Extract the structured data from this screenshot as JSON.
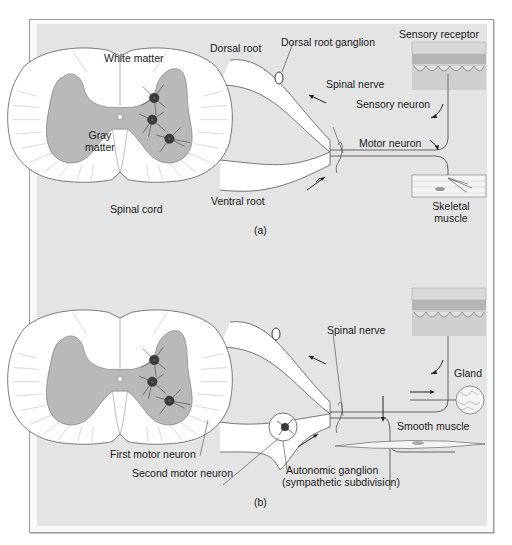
{
  "figure": {
    "panels": [
      {
        "id": "a",
        "caption": "(a)",
        "labels": {
          "white_matter": "White matter",
          "gray_matter_1": "Gray",
          "gray_matter_2": "matter",
          "spinal_cord": "Spinal cord",
          "dorsal_root": "Dorsal root",
          "dorsal_root_ganglion": "Dorsal root ganglion",
          "ventral_root": "Ventral root",
          "spinal_nerve": "Spinal nerve",
          "sensory_receptor": "Sensory receptor",
          "sensory_neuron": "Sensory neuron",
          "motor_neuron": "Motor neuron",
          "skeletal_muscle_1": "Skeletal",
          "skeletal_muscle_2": "muscle"
        }
      },
      {
        "id": "b",
        "caption": "(b)",
        "labels": {
          "spinal_nerve": "Spinal nerve",
          "gland": "Gland",
          "smooth_muscle": "Smooth muscle",
          "first_motor_neuron": "First motor neuron",
          "second_motor_neuron": "Second motor neuron",
          "autonomic_ganglion_1": "Autonomic ganglion",
          "autonomic_ganglion_2": "(sympathetic subdivision)"
        }
      }
    ],
    "colors": {
      "background": "#e4e4e4",
      "white_matter": "#ffffff",
      "gray_matter": "#b9b9b9",
      "neuron_body": "#3a3a3a",
      "outline": "#555555",
      "text": "#1a1a1a"
    }
  }
}
